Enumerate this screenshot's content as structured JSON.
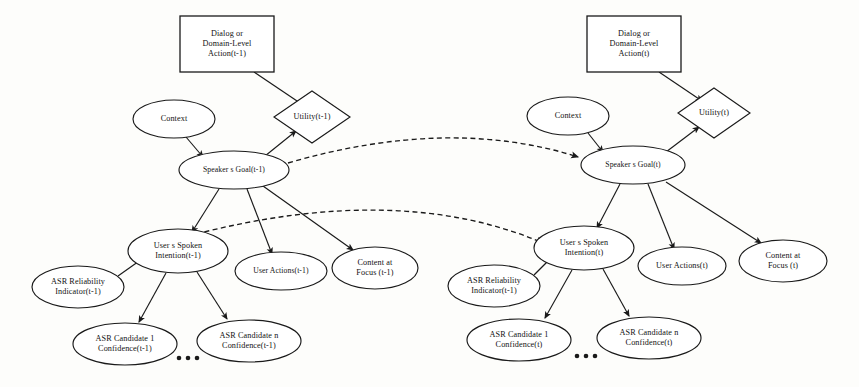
{
  "diagram": {
    "type": "bayesian-network",
    "colors": {
      "stroke": "#1a1a1a",
      "node_fill": "#ffffff",
      "background": "#fdfdfb"
    },
    "slices": [
      {
        "id": "slice-t-minus-1",
        "time_label": "(t-1)",
        "nodes": [
          {
            "id": "dialog-action-prev",
            "shape": "rectangle",
            "lines": [
              "Dialog or",
              "Domain-Level",
              "Action(t-1)"
            ],
            "cx": 227,
            "cy": 44,
            "w": 94,
            "h": 56
          },
          {
            "id": "utility-prev",
            "shape": "diamond",
            "lines": [
              "Utility(t-1)"
            ],
            "cx": 312,
            "cy": 117,
            "w": 76,
            "h": 52
          },
          {
            "id": "context-prev",
            "shape": "ellipse",
            "lines": [
              "Context"
            ],
            "cx": 174,
            "cy": 119,
            "w": 82,
            "h": 38
          },
          {
            "id": "speakers-goal-prev",
            "shape": "ellipse",
            "lines": [
              "Speaker s Goal(t-1)"
            ],
            "cx": 234,
            "cy": 170,
            "w": 110,
            "h": 38
          },
          {
            "id": "spoken-intention-prev",
            "shape": "ellipse",
            "lines": [
              "User s Spoken",
              "Intention(t-1)"
            ],
            "cx": 178,
            "cy": 251,
            "w": 100,
            "h": 44
          },
          {
            "id": "user-actions-prev",
            "shape": "ellipse",
            "lines": [
              "User Actions(t-1)"
            ],
            "cx": 281,
            "cy": 271,
            "w": 92,
            "h": 38
          },
          {
            "id": "content-focus-prev",
            "shape": "ellipse",
            "lines": [
              "Content at",
              "Focus (t-1)"
            ],
            "cx": 375,
            "cy": 268,
            "w": 86,
            "h": 42
          },
          {
            "id": "asr-reliability-prev",
            "shape": "ellipse",
            "lines": [
              "ASR Reliability",
              "Indicator(t-1)"
            ],
            "cx": 78,
            "cy": 287,
            "w": 92,
            "h": 42
          },
          {
            "id": "asr-candidate-1-prev",
            "shape": "ellipse",
            "lines": [
              "ASR Candidate 1",
              "Confidence(t-1)"
            ],
            "cx": 125,
            "cy": 344,
            "w": 104,
            "h": 42
          },
          {
            "id": "asr-candidate-n-prev",
            "shape": "ellipse",
            "lines": [
              "ASR Candidate n",
              "Confidence(t-1)"
            ],
            "cx": 249,
            "cy": 341,
            "w": 104,
            "h": 42
          }
        ],
        "ellipsis": {
          "cx": 188,
          "cy": 358,
          "count": 3
        }
      },
      {
        "id": "slice-t",
        "time_label": "(t)",
        "nodes": [
          {
            "id": "dialog-action-cur",
            "shape": "rectangle",
            "lines": [
              "Dialog or",
              "Domain-Level",
              "Action(t)"
            ],
            "cx": 634,
            "cy": 44,
            "w": 94,
            "h": 56
          },
          {
            "id": "utility-cur",
            "shape": "diamond",
            "lines": [
              "Utility(t)"
            ],
            "cx": 714,
            "cy": 113,
            "w": 72,
            "h": 50
          },
          {
            "id": "context-cur",
            "shape": "ellipse",
            "lines": [
              "Context"
            ],
            "cx": 568,
            "cy": 116,
            "w": 82,
            "h": 38
          },
          {
            "id": "speakers-goal-cur",
            "shape": "ellipse",
            "lines": [
              "Speaker s Goal(t)"
            ],
            "cx": 633,
            "cy": 165,
            "w": 104,
            "h": 38
          },
          {
            "id": "spoken-intention-cur",
            "shape": "ellipse",
            "lines": [
              "User s Spoken",
              "Intention(t)"
            ],
            "cx": 584,
            "cy": 248,
            "w": 100,
            "h": 44
          },
          {
            "id": "user-actions-cur",
            "shape": "ellipse",
            "lines": [
              "User Actions(t)"
            ],
            "cx": 682,
            "cy": 266,
            "w": 88,
            "h": 38
          },
          {
            "id": "content-focus-cur",
            "shape": "ellipse",
            "lines": [
              "Content at",
              "Focus (t)"
            ],
            "cx": 783,
            "cy": 261,
            "w": 88,
            "h": 42
          },
          {
            "id": "asr-reliability-cur",
            "shape": "ellipse",
            "lines": [
              "ASR Reliability",
              "Indicator(t-1)"
            ],
            "cx": 494,
            "cy": 286,
            "w": 92,
            "h": 42
          },
          {
            "id": "asr-candidate-1-cur",
            "shape": "ellipse",
            "lines": [
              "ASR Candidate 1",
              "Confidence(t)"
            ],
            "cx": 519,
            "cy": 340,
            "w": 104,
            "h": 42
          },
          {
            "id": "asr-candidate-n-cur",
            "shape": "ellipse",
            "lines": [
              "ASR Candidate n",
              "Confidence(t)"
            ],
            "cx": 649,
            "cy": 338,
            "w": 104,
            "h": 42
          }
        ],
        "ellipsis": {
          "cx": 586,
          "cy": 356,
          "count": 3
        }
      }
    ],
    "edges": [
      {
        "id": "e1",
        "from": "dialog-action-prev",
        "to": "utility-prev",
        "style": "solid",
        "path": "M 254 72 L 303 105"
      },
      {
        "id": "e2",
        "from": "context-prev",
        "to": "speakers-goal-prev",
        "style": "solid",
        "path": "M 186 137 L 203 157"
      },
      {
        "id": "e3",
        "from": "speakers-goal-prev",
        "to": "utility-prev",
        "style": "solid",
        "path": "M 265 156 L 296 131"
      },
      {
        "id": "e4",
        "from": "speakers-goal-prev",
        "to": "spoken-intention-prev",
        "style": "solid",
        "path": "M 219 189 L 192 232"
      },
      {
        "id": "e5",
        "from": "speakers-goal-prev",
        "to": "user-actions-prev",
        "style": "solid",
        "path": "M 247 189 L 272 254"
      },
      {
        "id": "e6",
        "from": "speakers-goal-prev",
        "to": "content-focus-prev",
        "style": "solid",
        "path": "M 263 186 L 353 250"
      },
      {
        "id": "e7",
        "from": "asr-reliability-prev",
        "to": "spoken-intention-prev",
        "style": "solid",
        "path": "M 118 276 L 142 259"
      },
      {
        "id": "e8",
        "from": "spoken-intention-prev",
        "to": "asr-candidate-1-prev",
        "style": "solid",
        "path": "M 166 273 L 139 322"
      },
      {
        "id": "e9",
        "from": "spoken-intention-prev",
        "to": "asr-candidate-n-prev",
        "style": "solid",
        "path": "M 197 272 L 227 319"
      },
      {
        "id": "e10",
        "from": "dialog-action-cur",
        "to": "utility-cur",
        "style": "solid",
        "path": "M 659 72 L 702 101"
      },
      {
        "id": "e11",
        "from": "context-cur",
        "to": "speakers-goal-cur",
        "style": "solid",
        "path": "M 588 133 L 603 152"
      },
      {
        "id": "e12",
        "from": "speakers-goal-cur",
        "to": "utility-cur",
        "style": "solid",
        "path": "M 666 152 L 699 127"
      },
      {
        "id": "e13",
        "from": "speakers-goal-cur",
        "to": "spoken-intention-cur",
        "style": "solid",
        "path": "M 620 184 L 597 228"
      },
      {
        "id": "e14",
        "from": "speakers-goal-cur",
        "to": "user-actions-cur",
        "style": "solid",
        "path": "M 648 184 L 674 249"
      },
      {
        "id": "e15",
        "from": "speakers-goal-cur",
        "to": "content-focus-cur",
        "style": "solid",
        "path": "M 666 182 L 761 243"
      },
      {
        "id": "e16",
        "from": "asr-reliability-cur",
        "to": "spoken-intention-cur",
        "style": "solid",
        "path": "M 534 275 L 551 258"
      },
      {
        "id": "e17",
        "from": "spoken-intention-cur",
        "to": "asr-candidate-1-cur",
        "style": "solid",
        "path": "M 572 270 L 545 318"
      },
      {
        "id": "e18",
        "from": "spoken-intention-cur",
        "to": "asr-candidate-n-cur",
        "style": "solid",
        "path": "M 603 269 L 629 316"
      },
      {
        "id": "e19",
        "from": "speakers-goal-prev",
        "to": "speakers-goal-cur",
        "style": "dashed",
        "path": "M 288 163 Q 450 116 578 157"
      },
      {
        "id": "e20",
        "from": "speakers-goal-prev",
        "to": "spoken-intention-cur",
        "style": "dashed",
        "path": "M 196 234 Q 400 182 543 243"
      }
    ]
  }
}
